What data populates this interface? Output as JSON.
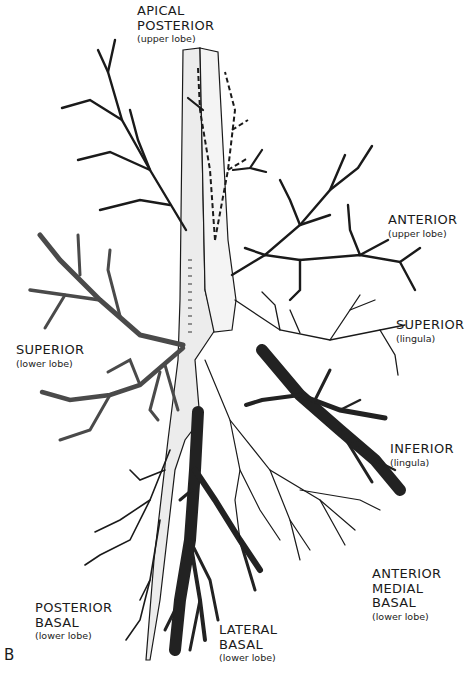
{
  "figure": {
    "panel_letter": "B",
    "colors": {
      "background": "#ffffff",
      "outline": "#1a1a1a",
      "light_fill": "#e6e6e6",
      "stippled_fill": "#bdbdbd",
      "dark_fill": "#222222"
    }
  },
  "labels": {
    "apical_posterior": {
      "lines": [
        "APICAL",
        "POSTERIOR"
      ],
      "sub": "(upper lobe)"
    },
    "anterior_upper": {
      "lines": [
        "ANTERIOR"
      ],
      "sub": "(upper lobe)"
    },
    "superior_lingula": {
      "lines": [
        "SUPERIOR"
      ],
      "sub": "(lingula)"
    },
    "superior_lower": {
      "lines": [
        "SUPERIOR"
      ],
      "sub": "(lower lobe)"
    },
    "inferior_lingula": {
      "lines": [
        "INFERIOR"
      ],
      "sub": "(lingula)"
    },
    "anterior_medial_basal": {
      "lines": [
        "ANTERIOR",
        "MEDIAL",
        "BASAL"
      ],
      "sub": "(lower lobe)"
    },
    "posterior_basal": {
      "lines": [
        "POSTERIOR",
        "BASAL"
      ],
      "sub": "(lower lobe)"
    },
    "lateral_basal": {
      "lines": [
        "LATERAL",
        "BASAL"
      ],
      "sub": "(lower lobe)"
    }
  }
}
